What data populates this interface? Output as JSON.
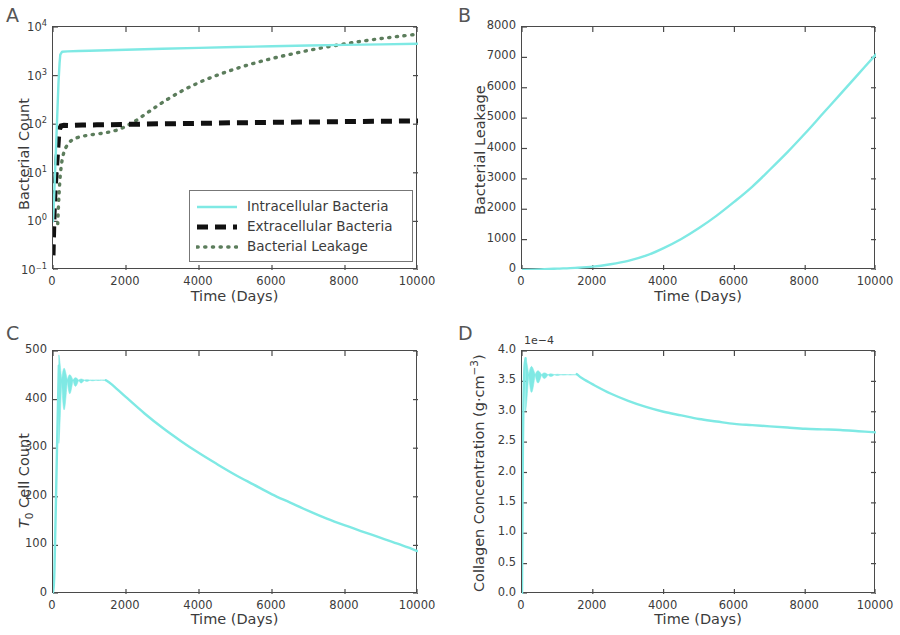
{
  "figure": {
    "width": 900,
    "height": 635,
    "background": "#ffffff",
    "colors": {
      "cyan": "#7fe9e4",
      "black": "#111111",
      "leakage_green": "#5c7d5c",
      "axis": "#4a4a4a",
      "text": "#3b3b3b"
    }
  },
  "panels": [
    {
      "letter": "A",
      "xlabel": "Time (Days)",
      "ylabel": "Bacterial Count",
      "xticks": [
        "0",
        "2000",
        "4000",
        "6000",
        "8000",
        "10000"
      ],
      "yticks": [
        "10⁴",
        "10³",
        "10²",
        "10¹",
        "10⁰",
        "10⁻¹"
      ],
      "legend": {
        "items": [
          {
            "label": "Intracellular Bacteria",
            "style": "solid",
            "color": "#7fe9e4"
          },
          {
            "label": "Extracellular Bacteria",
            "style": "dashed",
            "color": "#111111"
          },
          {
            "label": "Bacterial Leakage",
            "style": "dotted",
            "color": "#5c7d5c"
          }
        ]
      }
    },
    {
      "letter": "B",
      "xlabel": "Time (Days)",
      "ylabel": "Bacterial Leakage",
      "xticks": [
        "0",
        "2000",
        "4000",
        "6000",
        "8000",
        "10000"
      ],
      "yticks": [
        "8000",
        "7000",
        "6000",
        "5000",
        "4000",
        "3000",
        "2000",
        "1000",
        "0"
      ]
    },
    {
      "letter": "C",
      "xlabel": "Time (Days)",
      "ylabel_html": "<span class=\"ital\">T</span><sub>0</sub> Cell Count",
      "xticks": [
        "0",
        "2000",
        "4000",
        "6000",
        "8000",
        "10000"
      ],
      "yticks": [
        "500",
        "400",
        "300",
        "200",
        "100",
        "0"
      ]
    },
    {
      "letter": "D",
      "xlabel": "Time (Days)",
      "ylabel_html": "Collagen Concentration (g·cm<sup>−3</sup>)",
      "offset_text": "1e−4",
      "xticks": [
        "0",
        "2000",
        "4000",
        "6000",
        "8000",
        "10000"
      ],
      "yticks": [
        "4.0",
        "3.5",
        "3.0",
        "2.5",
        "2.0",
        "1.5",
        "1.0",
        "0.5",
        "0.0"
      ]
    }
  ],
  "chart_data": [
    {
      "panel": "A",
      "type": "line",
      "title": "",
      "xlabel": "Time (Days)",
      "ylabel": "Bacterial Count",
      "xlim": [
        0,
        10000
      ],
      "ylim": [
        0.1,
        10000
      ],
      "yscale": "log",
      "grid": false,
      "legend_position": "lower right",
      "series": [
        {
          "name": "Intracellular Bacteria",
          "style": "solid",
          "color": "#7fe9e4",
          "x": [
            0,
            30,
            60,
            90,
            120,
            150,
            180,
            200,
            250,
            400,
            700,
            1000,
            1500,
            2000,
            3000,
            4000,
            5000,
            6000,
            7000,
            8000,
            9000,
            10000
          ],
          "y": [
            1,
            3,
            12,
            45,
            180,
            700,
            1800,
            2700,
            3100,
            3150,
            3200,
            3250,
            3330,
            3400,
            3560,
            3720,
            3870,
            4010,
            4150,
            4280,
            4400,
            4520
          ]
        },
        {
          "name": "Extracellular Bacteria",
          "style": "dashed",
          "color": "#111111",
          "x": [
            0,
            30,
            60,
            90,
            120,
            150,
            180,
            220,
            300,
            500,
            800,
            1200,
            2000,
            3000,
            4000,
            5000,
            6000,
            7000,
            8000,
            9000,
            10000
          ],
          "y": [
            0.2,
            1.5,
            5,
            11,
            24,
            52,
            80,
            92,
            95,
            94,
            96,
            97,
            99,
            102,
            104,
            107,
            109,
            111,
            113,
            115,
            117
          ]
        },
        {
          "name": "Bacterial Leakage",
          "style": "dotted",
          "color": "#5c7d5c",
          "x": [
            130,
            160,
            200,
            260,
            350,
            500,
            700,
            1000,
            1400,
            1800,
            2200,
            2600,
            3000,
            3500,
            4000,
            4500,
            5000,
            5500,
            6000,
            6500,
            7000,
            7500,
            8000,
            8500,
            9000,
            9500,
            10000
          ],
          "y": [
            0.9,
            3,
            9,
            20,
            33,
            46,
            54,
            60,
            66,
            78,
            110,
            175,
            280,
            470,
            720,
            1020,
            1380,
            1790,
            2250,
            2740,
            3300,
            3880,
            4500,
            5150,
            5800,
            6450,
            7100
          ]
        }
      ]
    },
    {
      "panel": "B",
      "type": "line",
      "title": "",
      "xlabel": "Time (Days)",
      "ylabel": "Bacterial Leakage",
      "xlim": [
        0,
        10000
      ],
      "ylim": [
        0,
        8000
      ],
      "grid": false,
      "series": [
        {
          "name": "Bacterial Leakage",
          "style": "solid",
          "color": "#7fe9e4",
          "x": [
            0,
            500,
            1000,
            1500,
            2000,
            2500,
            3000,
            3500,
            4000,
            4500,
            5000,
            5500,
            6000,
            6500,
            7000,
            7500,
            8000,
            8500,
            9000,
            9500,
            10000
          ],
          "y": [
            0,
            20,
            45,
            70,
            110,
            190,
            300,
            470,
            720,
            1020,
            1380,
            1790,
            2250,
            2740,
            3300,
            3880,
            4500,
            5150,
            5800,
            6450,
            7100
          ]
        }
      ]
    },
    {
      "panel": "C",
      "type": "line",
      "title": "",
      "xlabel": "Time (Days)",
      "ylabel": "T0 Cell Count",
      "xlim": [
        0,
        10000
      ],
      "ylim": [
        0,
        500
      ],
      "grid": false,
      "series": [
        {
          "name": "T0 Cell Count",
          "style": "solid",
          "color": "#7fe9e4",
          "x": [
            0,
            60,
            120,
            160,
            200,
            240,
            280,
            320,
            380,
            450,
            550,
            700,
            900,
            1100,
            1300,
            1450,
            1600,
            2000,
            2500,
            3000,
            3500,
            4000,
            4500,
            5000,
            5500,
            6000,
            6500,
            7000,
            7500,
            8000,
            8500,
            9000,
            9500,
            10000
          ],
          "y": [
            5,
            60,
            280,
            470,
            490,
            420,
            455,
            425,
            448,
            432,
            442,
            437,
            441,
            440,
            441,
            440,
            432,
            405,
            372,
            342,
            315,
            290,
            267,
            245,
            225,
            205,
            188,
            171,
            155,
            141,
            128,
            115,
            102,
            88
          ]
        }
      ]
    },
    {
      "panel": "D",
      "type": "line",
      "title": "",
      "xlabel": "Time (Days)",
      "ylabel": "Collagen Concentration (g.cm-3)",
      "xlim": [
        0,
        10000
      ],
      "ylim": [
        0.0,
        4.0
      ],
      "y_offset_exponent": "1e-4",
      "grid": false,
      "series": [
        {
          "name": "Collagen Concentration",
          "style": "solid",
          "color": "#7fe9e4",
          "x": [
            0,
            60,
            130,
            180,
            230,
            280,
            330,
            400,
            480,
            600,
            800,
            1000,
            1200,
            1400,
            1550,
            1700,
            2000,
            2500,
            3000,
            3500,
            4000,
            4500,
            5000,
            5500,
            6000,
            6500,
            7000,
            7500,
            8000,
            8500,
            9000,
            9500,
            10000
          ],
          "y": [
            3.88,
            3.85,
            3.05,
            3.72,
            3.18,
            3.62,
            3.35,
            3.66,
            3.46,
            3.62,
            3.58,
            3.6,
            3.6,
            3.61,
            3.62,
            3.55,
            3.45,
            3.3,
            3.18,
            3.08,
            3.0,
            2.94,
            2.88,
            2.84,
            2.8,
            2.78,
            2.76,
            2.74,
            2.72,
            2.71,
            2.7,
            2.68,
            2.66
          ]
        }
      ]
    }
  ]
}
